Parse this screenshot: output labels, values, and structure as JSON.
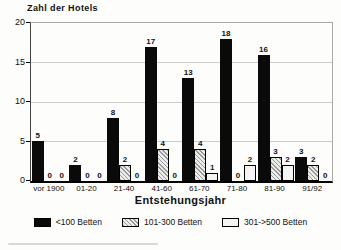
{
  "chart_data": {
    "type": "bar",
    "title": "",
    "ylabel": "Zahl der Hotels",
    "xlabel": "Entstehungsjahr",
    "ylim": [
      0,
      20
    ],
    "yticks": [
      0,
      5,
      10,
      15,
      20
    ],
    "grid": true,
    "legend_position": "bottom",
    "value_labels": true,
    "categories": [
      "vor 1900",
      "01-20",
      "21-40",
      "41-60",
      "61-70",
      "71-80",
      "81-90",
      "91/92"
    ],
    "series": [
      {
        "name": "<100 Betten",
        "style": "solid-black",
        "values": [
          5,
          2,
          8,
          17,
          13,
          18,
          16,
          3
        ]
      },
      {
        "name": "101-300 Betten",
        "style": "hatched-gray",
        "values": [
          0,
          0,
          2,
          4,
          4,
          0,
          3,
          2
        ]
      },
      {
        "name": "301->500 Betten",
        "style": "light-gray",
        "values": [
          0,
          0,
          0,
          0,
          1,
          2,
          2,
          0
        ]
      }
    ]
  },
  "colors": {
    "bar_black": "#0a0a0a",
    "hatch_line": "#9a9a9a",
    "hatch_bg": "#ececea",
    "light_fill": "#f4f4f2",
    "grid": "#cccccb",
    "frame": "#a8a8a6",
    "axis": "#000000",
    "text": "#111111",
    "background": "#fdfdfc"
  }
}
